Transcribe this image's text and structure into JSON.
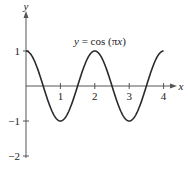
{
  "chart_data": {
    "type": "line",
    "title": "y = cos (πx)",
    "title_parts": {
      "lhs": "y",
      "eq": " = cos (π",
      "var": "x",
      "close": ")"
    },
    "xlabel": "x",
    "ylabel": "y",
    "xlim": [
      0,
      4
    ],
    "ylim": [
      -2,
      1
    ],
    "xticks": [
      "1",
      "2",
      "3",
      "4"
    ],
    "yticks": [
      "1",
      "−1",
      "−2"
    ],
    "grid": false,
    "series": [
      {
        "name": "y = cos(πx)",
        "x": [
          0,
          0.5,
          1,
          1.5,
          2,
          2.5,
          3,
          3.5,
          4
        ],
        "values": [
          1,
          0,
          -1,
          0,
          1,
          0,
          -1,
          0,
          1
        ]
      }
    ]
  },
  "colors": {
    "curve": "#2a2a2a",
    "axis": "#555555",
    "text": "#222222"
  }
}
